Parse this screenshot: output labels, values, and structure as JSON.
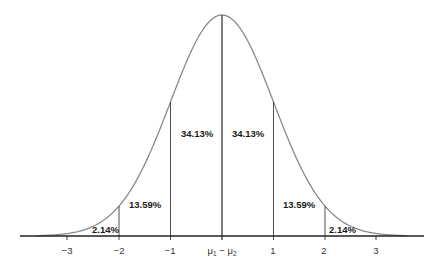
{
  "chart_data": {
    "type": "area",
    "title": "",
    "xlabel": "",
    "ylabel": "",
    "x_ticks": [
      "-3",
      "-2",
      "-1",
      "μ1 − μ2",
      "1",
      "2",
      "3"
    ],
    "x_tick_values": [
      -3,
      -2,
      -1,
      0,
      1,
      2,
      3
    ],
    "xlim": [
      -3.6,
      3.6
    ],
    "grid": false,
    "legend": null,
    "vertical_lines_at": [
      -2,
      -1,
      0,
      1,
      2
    ],
    "regions": [
      {
        "from": -3,
        "to": -2,
        "label": "2.14%",
        "value": 2.14
      },
      {
        "from": -2,
        "to": -1,
        "label": "13.59%",
        "value": 13.59
      },
      {
        "from": -1,
        "to": 0,
        "label": "34.13%",
        "value": 34.13
      },
      {
        "from": 0,
        "to": 1,
        "label": "34.13%",
        "value": 34.13
      },
      {
        "from": 1,
        "to": 2,
        "label": "13.59%",
        "value": 13.59
      },
      {
        "from": 2,
        "to": 3,
        "label": "2.14%",
        "value": 2.14
      }
    ],
    "center_label": "μ1 − μ2"
  },
  "labels": {
    "r1": "2.14%",
    "r2": "13.59%",
    "r3": "34.13%",
    "r4": "34.13%",
    "r5": "13.59%",
    "r6": "2.14%"
  },
  "ticks": {
    "m3": "−3",
    "m2": "−2",
    "m1": "−1",
    "p1": "1",
    "p2": "2",
    "p3": "3"
  },
  "colors": {
    "curve": "#8a8a8a",
    "lines": "#3a3a3a",
    "axis": "#222222",
    "text": "#1a1a1a"
  }
}
